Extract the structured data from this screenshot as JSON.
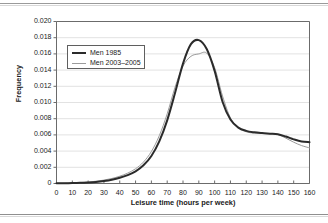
{
  "chart_data": {
    "type": "line",
    "title": "",
    "xlabel": "Leisure time (hours per week)",
    "ylabel": "Frequency",
    "xlim": [
      0,
      160
    ],
    "ylim": [
      0,
      0.02
    ],
    "grid": "horizontal",
    "legend_position": "upper-left-inside",
    "xticks": [
      "0",
      "10",
      "20",
      "30",
      "40",
      "50",
      "60",
      "70",
      "80",
      "90",
      "100",
      "110",
      "120",
      "130",
      "140",
      "150",
      "160"
    ],
    "xtick_values": [
      0,
      10,
      20,
      30,
      40,
      50,
      60,
      70,
      80,
      90,
      100,
      110,
      120,
      130,
      140,
      150,
      160
    ],
    "yticks": [
      "0",
      "0.002",
      "0.004",
      "0.006",
      "0.008",
      "0.010",
      "0.012",
      "0.014",
      "0.016",
      "0.018",
      "0.020"
    ],
    "ytick_values": [
      0,
      0.002,
      0.004,
      0.006,
      0.008,
      0.01,
      0.012,
      0.014,
      0.016,
      0.018,
      0.02
    ],
    "x": [
      0,
      5,
      10,
      15,
      20,
      25,
      30,
      35,
      40,
      45,
      50,
      55,
      60,
      65,
      70,
      75,
      80,
      85,
      90,
      95,
      100,
      105,
      110,
      115,
      120,
      125,
      130,
      135,
      140,
      145,
      150,
      155,
      160
    ],
    "series": [
      {
        "name": "Men 1985",
        "color": "#2b2b2b",
        "line_width": 2,
        "peak_x": 90,
        "peak_y": 0.0177,
        "values": [
          2e-05,
          3e-05,
          5e-05,
          8e-05,
          0.00013,
          0.0002,
          0.00031,
          0.00047,
          0.0007,
          0.00103,
          0.0015,
          0.00225,
          0.0034,
          0.0052,
          0.0078,
          0.0112,
          0.0148,
          0.0172,
          0.0177,
          0.0166,
          0.0139,
          0.0101,
          0.0079,
          0.0069,
          0.0065,
          0.00632,
          0.00622,
          0.00615,
          0.00608,
          0.0058,
          0.00545,
          0.00518,
          0.0051
        ]
      },
      {
        "name": "Men 2003–2005",
        "color": "#9b9b9b",
        "line_width": 1,
        "peak_x": 95,
        "peak_y": 0.0161,
        "values": [
          2e-05,
          4e-05,
          7e-05,
          0.00011,
          0.00018,
          0.00028,
          0.00042,
          0.00062,
          0.0009,
          0.00128,
          0.00182,
          0.00265,
          0.00395,
          0.0059,
          0.0086,
          0.0119,
          0.0145,
          0.0157,
          0.016,
          0.0161,
          0.0143,
          0.0108,
          0.0081,
          0.0069,
          0.00638,
          0.00622,
          0.00618,
          0.00614,
          0.00605,
          0.0056,
          0.0051,
          0.00468,
          0.0044
        ]
      }
    ]
  }
}
